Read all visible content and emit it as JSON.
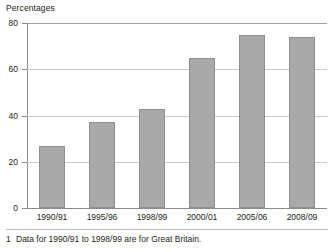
{
  "chart_data": {
    "type": "bar",
    "title": "Percentages",
    "xlabel": "",
    "ylabel": "Percentages",
    "categories": [
      "1990/91",
      "1995/96",
      "1998/99",
      "2000/01",
      "2005/06",
      "2008/09"
    ],
    "values": [
      27,
      37,
      43,
      65,
      75,
      74
    ],
    "series": [
      {
        "name": "Percentages",
        "values": [
          27,
          37,
          43,
          65,
          75,
          74
        ]
      }
    ],
    "ylim": [
      0,
      80
    ],
    "yticks": [
      0,
      20,
      40,
      60,
      80
    ],
    "ytick_labels": [
      "0",
      "20",
      "40",
      "60",
      "80"
    ],
    "grid": "horizontal",
    "legend": "none",
    "bar_color": "#a9a9a9",
    "bar_border_color": "#8f8f8f",
    "gridline_color": "#c9c9c9",
    "axis_color": "#8c8c8c",
    "text_color": "#231f20"
  },
  "footnote": {
    "marker": "1",
    "text": "Data for 1990/91 to 1998/99 are for Great Britain."
  }
}
